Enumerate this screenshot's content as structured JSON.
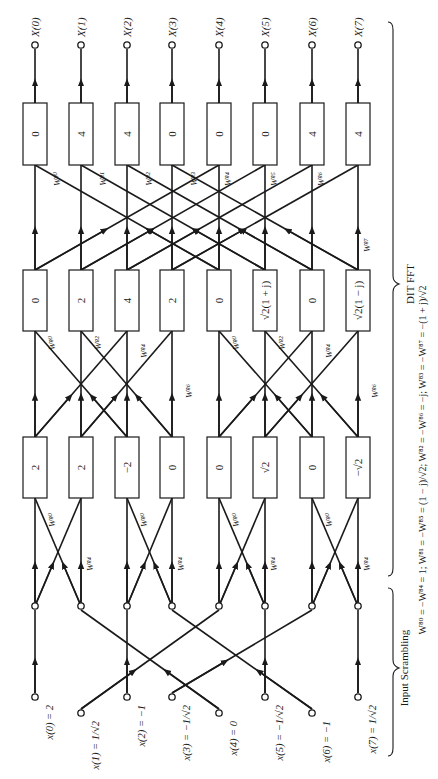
{
  "diagram": {
    "orientation": "rotated-90-ccw (data flows bottom to top)",
    "columns_x": [
      35,
      81,
      127,
      172,
      219,
      265,
      312,
      358
    ],
    "inputs": [
      {
        "label": "x(0) = 2"
      },
      {
        "label": "x(1) = 1/√2"
      },
      {
        "label": "x(2) = −1"
      },
      {
        "label": "x(3) = −1/√2"
      },
      {
        "label": "x(4) = 0"
      },
      {
        "label": "x(5) = −1/√2"
      },
      {
        "label": "x(6) = −1"
      },
      {
        "label": "x(7) = 1/√2"
      }
    ],
    "scrambled_order": [
      0,
      4,
      2,
      6,
      1,
      5,
      3,
      7
    ],
    "stage1": {
      "values": [
        "2",
        "2",
        "−2",
        "0",
        "0",
        "√2",
        "0",
        "−√2"
      ],
      "twiddles": [
        "W⁸⁰",
        "W⁸⁴",
        "W⁸⁰",
        "W⁸⁴",
        "W⁸⁰",
        "W⁸⁴",
        "W⁸⁰",
        "W⁸⁴"
      ]
    },
    "stage2": {
      "values": [
        "0",
        "2",
        "4",
        "2",
        "0",
        "√2(1 + j)",
        "0",
        "√2(1 − j)"
      ],
      "twiddles": [
        "W⁸⁰",
        "W⁸²",
        "W⁸⁴",
        "W⁸⁶",
        "W⁸⁰",
        "W⁸²",
        "W⁸⁴",
        "W⁸⁶"
      ]
    },
    "stage3": {
      "values": [
        "0",
        "4",
        "4",
        "0",
        "0",
        "0",
        "4",
        "4"
      ],
      "twiddles": [
        "W⁸⁰",
        "W⁸¹",
        "W⁸²",
        "W⁸³",
        "W⁸⁴",
        "W⁸⁵",
        "W⁸⁶",
        "W⁸⁷"
      ]
    },
    "outputs": [
      "X(0)",
      "X(1)",
      "X(2)",
      "X(3)",
      "X(4)",
      "X(5)",
      "X(6)",
      "X(7)"
    ],
    "braces": {
      "input": "Input Scrambling",
      "fft": "DIT    FFT"
    },
    "footnote": "W⁸⁰ = −W⁸⁴ = 1; W⁸¹ = −W⁸⁵ = (1 − j)/√2; W⁸² = −W⁸⁶ = −j; W⁸³ = −W⁸⁷ = −(1 + j)/√2",
    "twiddle_text": {
      "w0": "W",
      "sup0": "0",
      "sub": "8"
    }
  }
}
